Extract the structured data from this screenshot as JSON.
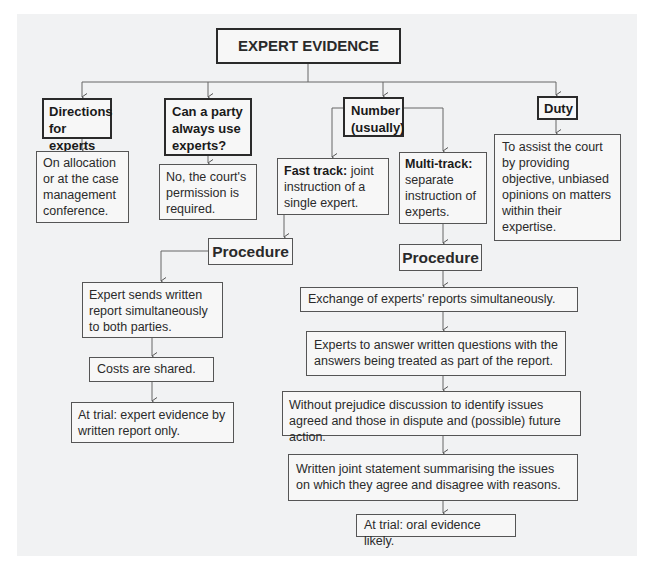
{
  "title": "EXPERT EVIDENCE",
  "branches": {
    "directions": {
      "heading": "Directions for experts",
      "detail": "On allocation or at the case management conference."
    },
    "can_party": {
      "heading": "Can a party always use experts?",
      "detail": "No, the court's permission is required."
    },
    "number": {
      "heading": "Number (usually)",
      "fast_track": {
        "lead": "Fast track:",
        "text": " joint instruction of a single expert."
      },
      "multi_track": {
        "lead": "Multi-track:",
        "text": " separate instruction of experts."
      }
    },
    "duty": {
      "heading": "Duty",
      "detail": "To assist the court by providing objective, unbiased opinions on matters within their expertise."
    }
  },
  "fast_procedure": {
    "heading": "Procedure",
    "steps": [
      "Expert sends written report simultaneously to both parties.",
      "Costs are shared.",
      "At trial: expert evidence by written report only."
    ]
  },
  "multi_procedure": {
    "heading": "Procedure",
    "steps": [
      "Exchange of experts' reports simultaneously.",
      "Experts to answer written questions with the answers being treated as part of the report.",
      "Without prejudice discussion to identify issues agreed and those in dispute and (possible) future action.",
      "Written joint statement summarising the issues on which they agree and disagree with reasons.",
      "At trial: oral evidence likely."
    ]
  }
}
